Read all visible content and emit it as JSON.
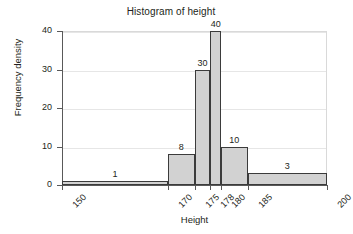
{
  "chart_data": {
    "type": "bar",
    "title": "Histogram of height",
    "xlabel": "Height",
    "ylabel": "Frequency density",
    "xlim": [
      150,
      200
    ],
    "ylim": [
      0,
      40
    ],
    "grid": true,
    "legend": "none",
    "x_breaks": [
      150,
      170,
      175,
      178,
      180,
      185,
      200
    ],
    "x_tick_labels": [
      "150",
      "170",
      "175",
      "178",
      "180",
      "185",
      "200"
    ],
    "y_ticks": [
      0,
      10,
      20,
      30,
      40
    ],
    "y_tick_labels": [
      "0",
      "10",
      "20",
      "30",
      "40"
    ],
    "bins": [
      {
        "from": 150,
        "to": 170,
        "value": 1,
        "label": "1"
      },
      {
        "from": 170,
        "to": 175,
        "value": 8,
        "label": "8"
      },
      {
        "from": 175,
        "to": 178,
        "value": 30,
        "label": "30"
      },
      {
        "from": 178,
        "to": 180,
        "value": 40,
        "label": "40"
      },
      {
        "from": 180,
        "to": 185,
        "value": 10,
        "label": "10"
      },
      {
        "from": 185,
        "to": 200,
        "value": 3,
        "label": "3"
      }
    ],
    "categories": [
      "150-170",
      "170-175",
      "175-178",
      "178-180",
      "180-185",
      "185-200"
    ],
    "values": [
      1,
      8,
      30,
      40,
      10,
      3
    ],
    "colors": {
      "bar_fill": "#d2d2d2",
      "bar_border": "#3b3b3b",
      "gridline": "#e6e6e6",
      "axis": "#595959",
      "text": "#231f20",
      "background": "#ffffff"
    }
  }
}
